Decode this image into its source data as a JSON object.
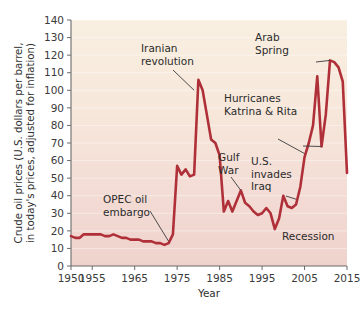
{
  "chart_data": {
    "type": "line",
    "title": "",
    "xlabel": "Year",
    "ylabel": "Crude oil prices (U.S. dollars per barrel, in today's prices, adjusted for inflation)",
    "ylabel_line1": "Crude oil prices (U.S. dollars per barrel,",
    "ylabel_line2": "in today's prices, adjusted for inflation)",
    "xlim": [
      1950,
      2015
    ],
    "ylim": [
      0,
      140
    ],
    "grid": true,
    "legend": "none",
    "yticks": [
      0,
      10,
      20,
      30,
      40,
      50,
      60,
      70,
      80,
      90,
      100,
      110,
      120,
      130,
      140
    ],
    "xticks": [
      1950,
      1955,
      1965,
      1975,
      1985,
      1995,
      2005,
      2015
    ],
    "xticklabels": [
      "1950",
      "1955",
      "1965",
      "1975",
      "1985",
      "1995",
      "2005",
      "2015"
    ],
    "yticklabels": [
      "0",
      "10",
      "20",
      "30",
      "40",
      "50",
      "60",
      "70",
      "80",
      "90",
      "100",
      "110",
      "120",
      "130",
      "140"
    ],
    "series": [
      {
        "name": "Crude oil price",
        "color": "#b03039",
        "x": [
          1950,
          1951,
          1952,
          1953,
          1954,
          1955,
          1956,
          1957,
          1958,
          1959,
          1960,
          1961,
          1962,
          1963,
          1964,
          1965,
          1966,
          1967,
          1968,
          1969,
          1970,
          1971,
          1972,
          1973,
          1974,
          1975,
          1976,
          1977,
          1978,
          1979,
          1980,
          1981,
          1982,
          1983,
          1984,
          1985,
          1986,
          1987,
          1988,
          1989,
          1990,
          1991,
          1992,
          1993,
          1994,
          1995,
          1996,
          1997,
          1998,
          1999,
          2000,
          2001,
          2002,
          2003,
          2004,
          2005,
          2006,
          2007,
          2008,
          2009,
          2010,
          2011,
          2012,
          2013,
          2014,
          2015
        ],
        "y": [
          17,
          16,
          16,
          18,
          18,
          18,
          18,
          18,
          17,
          17,
          18,
          17,
          16,
          16,
          15,
          15,
          15,
          14,
          14,
          14,
          13,
          13,
          12,
          13,
          18,
          57,
          52,
          55,
          51,
          52,
          106,
          100,
          86,
          72,
          70,
          63,
          31,
          37,
          31,
          37,
          43,
          36,
          34,
          31,
          29,
          30,
          33,
          30,
          21,
          27,
          40,
          34,
          33,
          35,
          45,
          62,
          70,
          80,
          108,
          68,
          86,
          117,
          116,
          113,
          105,
          53
        ],
        "annotations": [
          {
            "text": "OPEC oil embargo",
            "lines": [
              "OPEC oil",
              "embargo"
            ],
            "target_year": 1973,
            "target_value": 14
          },
          {
            "text": "Iranian revolution",
            "lines": [
              "Iranian",
              "revolution"
            ],
            "target_year": 1979,
            "target_value": 100
          },
          {
            "text": "Gulf War",
            "lines": [
              "Gulf",
              "War"
            ],
            "target_year": 1990,
            "target_value": 43
          },
          {
            "text": "U.S. invades Iraq",
            "lines": [
              "U.S.",
              "invades",
              "Iraq"
            ],
            "target_year": 2003,
            "target_value": 38
          },
          {
            "text": "Hurricanes Katrina & Rita",
            "lines": [
              "Hurricanes",
              "Katrina & Rita"
            ],
            "target_year": 2005,
            "target_value": 64
          },
          {
            "text": "Arab Spring",
            "lines": [
              "Arab",
              "Spring"
            ],
            "target_year": 2011,
            "target_value": 117
          },
          {
            "text": "Recession",
            "lines": [
              "Recession"
            ],
            "target_year": 2009,
            "target_value": 68
          }
        ]
      }
    ],
    "colors": {
      "line": "#b03039",
      "plot_bg_top": "#f7eddc",
      "plot_bg_bottom": "#f0d3cd",
      "axis": "#6b6b6b",
      "text": "#2f2f2f",
      "gridline": "#ffffff"
    }
  }
}
